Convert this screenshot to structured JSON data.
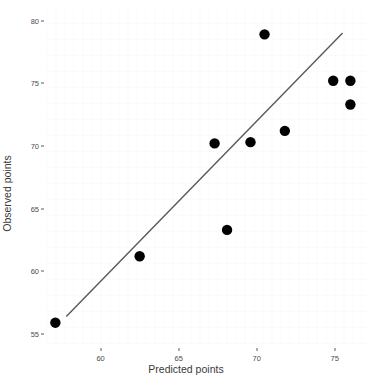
{
  "chart_data": {
    "type": "scatter",
    "title": "",
    "xlabel": "Predicted points",
    "ylabel": "Observed points",
    "xlim": [
      56.5,
      77.0
    ],
    "ylim": [
      54.2,
      81.0
    ],
    "xticks": [
      60,
      65,
      70,
      75
    ],
    "yticks": [
      55,
      60,
      65,
      70,
      75,
      80
    ],
    "xtick_labels": [
      "60",
      "65",
      "70",
      "75"
    ],
    "ytick_labels": [
      "55",
      "60",
      "65",
      "70",
      "75",
      "80"
    ],
    "grid": false,
    "legend": false,
    "point_color": "#000000",
    "point_size": 5.2,
    "line_color": "#595959",
    "background_color": "#FFFFFF",
    "points": [
      {
        "x": 57.1,
        "y": 55.9
      },
      {
        "x": 62.5,
        "y": 61.2
      },
      {
        "x": 68.1,
        "y": 63.3
      },
      {
        "x": 67.3,
        "y": 70.2
      },
      {
        "x": 69.6,
        "y": 70.3
      },
      {
        "x": 71.8,
        "y": 71.2
      },
      {
        "x": 70.5,
        "y": 78.9
      },
      {
        "x": 74.9,
        "y": 75.2
      },
      {
        "x": 76.0,
        "y": 75.2
      },
      {
        "x": 76.0,
        "y": 73.3
      }
    ],
    "fit_line": {
      "type": "line",
      "x": [
        57.8,
        75.5
      ],
      "y": [
        56.4,
        79.0
      ]
    }
  }
}
